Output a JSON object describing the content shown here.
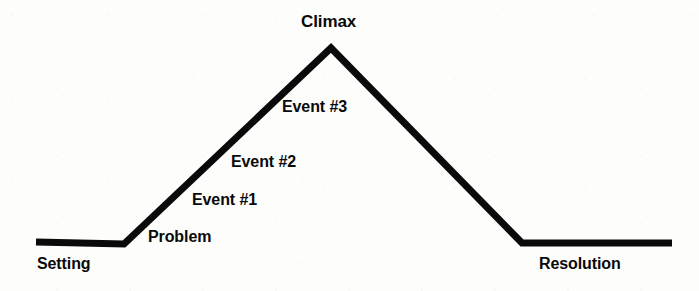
{
  "diagram": {
    "type": "story-arc",
    "background_color": "#fdfdfc",
    "line_color": "#0a0a0a",
    "text_color": "#0a0a0a",
    "line_width": 7,
    "labels": {
      "setting": "Setting",
      "problem": "Problem",
      "event1": "Event #1",
      "event2": "Event #2",
      "event3": "Event #3",
      "climax": "Climax",
      "resolution": "Resolution"
    },
    "stages": [
      {
        "key": "setting",
        "label": "Setting",
        "x": 80,
        "y": 266
      },
      {
        "key": "problem",
        "label": "Problem",
        "x": 184,
        "y": 238
      },
      {
        "key": "event1",
        "label": "Event #1",
        "x": 227,
        "y": 201
      },
      {
        "key": "event2",
        "label": "Event #2",
        "x": 266,
        "y": 163
      },
      {
        "key": "event3",
        "label": "Event #3",
        "x": 316,
        "y": 108
      },
      {
        "key": "climax",
        "label": "Climax",
        "x": 331,
        "y": 22
      },
      {
        "key": "resolution",
        "label": "Resolution",
        "x": 582,
        "y": 266
      }
    ],
    "polyline": "36,242 124,244 331,48 522,243 672,243"
  },
  "chart_data": {
    "type": "line",
    "xlabel": "",
    "ylabel": "",
    "grid": false,
    "legend": "none",
    "x": [
      36,
      124,
      331,
      522,
      672
    ],
    "values": [
      242,
      244,
      48,
      243,
      243
    ],
    "annotations": [
      "Setting",
      "Problem",
      "Event #1",
      "Event #2",
      "Event #3",
      "Climax",
      "Resolution"
    ]
  }
}
